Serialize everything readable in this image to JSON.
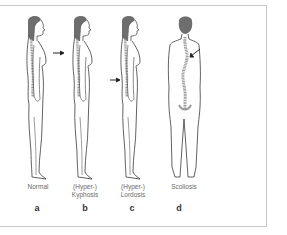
{
  "figure": {
    "panels": [
      {
        "letter": "a",
        "line1": "Normal",
        "line2": "",
        "view": "side",
        "arrow": false
      },
      {
        "letter": "b",
        "line1": "(Hyper-)",
        "line2": "Kyphosis",
        "view": "side",
        "arrow": true
      },
      {
        "letter": "c",
        "line1": "(Hyper-)",
        "line2": "Lordosis",
        "view": "side",
        "arrow": true
      },
      {
        "letter": "d",
        "line1": "Scoliosis",
        "line2": "",
        "view": "back",
        "arrow": true
      }
    ],
    "colors": {
      "outline": "#3a3a3a",
      "hair": "#6e6e6e",
      "spine": "#9a9a9a",
      "border": "#c8c8c8",
      "label": "#6a6a6a"
    }
  }
}
